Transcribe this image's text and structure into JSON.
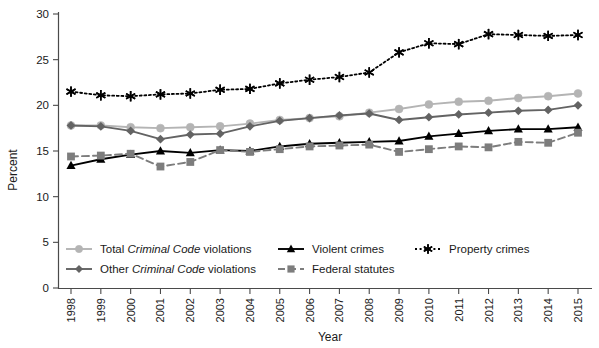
{
  "chart_data": {
    "type": "line",
    "title": "",
    "xlabel": "Year",
    "ylabel": "Percent",
    "ylim": [
      0,
      30
    ],
    "ytick_values": [
      0,
      5,
      10,
      15,
      20,
      25,
      30
    ],
    "grid": false,
    "legend_position": "bottom",
    "categories": [
      "1998",
      "1999",
      "2000",
      "2001",
      "2002",
      "2003",
      "2004",
      "2005",
      "2006",
      "2007",
      "2008",
      "2009",
      "2010",
      "2011",
      "2012",
      "2013",
      "2014",
      "2015"
    ],
    "series": [
      {
        "name": "Total Criminal Code violations",
        "name_plain": "Total Criminal Code violations",
        "color": "#b4b4b4",
        "marker": "circle",
        "dash": "solid",
        "values": [
          17.8,
          17.8,
          17.6,
          17.5,
          17.6,
          17.7,
          18.0,
          18.4,
          18.6,
          18.8,
          19.2,
          19.6,
          20.1,
          20.4,
          20.5,
          20.8,
          21.0,
          21.3
        ]
      },
      {
        "name": "Other Criminal Code violations",
        "name_plain": "Other Criminal Code violations",
        "color": "#636363",
        "marker": "diamond",
        "dash": "solid",
        "values": [
          17.8,
          17.7,
          17.2,
          16.3,
          16.8,
          16.9,
          17.7,
          18.3,
          18.6,
          18.9,
          19.1,
          18.4,
          18.7,
          19.0,
          19.2,
          19.4,
          19.5,
          20.0
        ]
      },
      {
        "name": "Violent crimes",
        "name_plain": "Violent crimes",
        "color": "#000000",
        "marker": "triangle",
        "dash": "solid",
        "values": [
          13.4,
          14.1,
          14.6,
          15.0,
          14.8,
          15.1,
          15.0,
          15.5,
          15.8,
          15.9,
          16.0,
          16.1,
          16.6,
          16.9,
          17.2,
          17.4,
          17.4,
          17.6
        ]
      },
      {
        "name": "Federal statutes",
        "name_plain": "Federal statutes",
        "color": "#7d7d7d",
        "marker": "square",
        "dash": "dashed",
        "values": [
          14.4,
          14.5,
          14.7,
          13.3,
          13.8,
          15.1,
          14.9,
          15.2,
          15.5,
          15.6,
          15.7,
          14.9,
          15.2,
          15.5,
          15.4,
          16.0,
          15.9,
          17.0
        ]
      },
      {
        "name": "Property crimes",
        "name_plain": "Property crimes",
        "color": "#000000",
        "marker": "asterisk",
        "dash": "dotted",
        "values": [
          21.5,
          21.1,
          21.0,
          21.2,
          21.3,
          21.7,
          21.8,
          22.4,
          22.8,
          23.1,
          23.6,
          25.8,
          26.8,
          26.7,
          27.8,
          27.7,
          27.6,
          27.7
        ]
      }
    ]
  },
  "axes": {
    "y_title": "Percent",
    "x_title": "Year",
    "y_ticks": [
      "0",
      "5",
      "10",
      "15",
      "20",
      "25",
      "30"
    ],
    "x_ticks": [
      "1998",
      "1999",
      "2000",
      "2001",
      "2002",
      "2003",
      "2004",
      "2005",
      "2006",
      "2007",
      "2008",
      "2009",
      "2010",
      "2011",
      "2012",
      "2013",
      "2014",
      "2015"
    ]
  },
  "legend": {
    "items": [
      {
        "label_pre": "Total ",
        "label_em": "Criminal Code",
        "label_post": " violations",
        "key": "total-criminal-code-violations"
      },
      {
        "label_pre": "Other ",
        "label_em": "Criminal Code",
        "label_post": " violations",
        "key": "other-criminal-code-violations"
      },
      {
        "label_pre": "Violent crimes",
        "label_em": "",
        "label_post": "",
        "key": "violent-crimes"
      },
      {
        "label_pre": "Federal statutes",
        "label_em": "",
        "label_post": "",
        "key": "federal-statutes"
      },
      {
        "label_pre": "Property crimes",
        "label_em": "",
        "label_post": "",
        "key": "property-crimes"
      }
    ]
  },
  "colors": {
    "total": "#b4b4b4",
    "other": "#636363",
    "violent": "#000000",
    "federal": "#7d7d7d",
    "property": "#000000",
    "axis": "#4a4a4a",
    "background": "#ffffff"
  }
}
